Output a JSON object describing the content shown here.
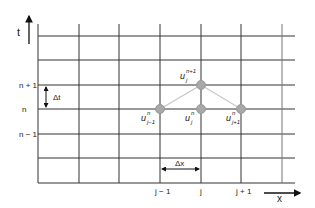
{
  "diagram": {
    "axes": {
      "t_label": "t",
      "x_label": "x"
    },
    "row_labels": [
      {
        "text": "n + 1",
        "y": 85
      },
      {
        "text": "n",
        "y": 109
      },
      {
        "text": "n − 1",
        "y": 134
      }
    ],
    "col_labels": [
      {
        "text": "j − 1",
        "x": 160
      },
      {
        "text": "j",
        "x": 201
      },
      {
        "text": "j + 1",
        "x": 241
      }
    ],
    "step_labels": {
      "dt": "Δt",
      "dx": "Δx"
    },
    "nodes": [
      {
        "id": "u_j_n1",
        "base": "u",
        "sub": "j",
        "sup": "n+1",
        "x": 201,
        "y": 85
      },
      {
        "id": "u_jm1_n",
        "base": "u",
        "sub": "j−1",
        "sup": "n",
        "x": 160,
        "y": 109
      },
      {
        "id": "u_j_n",
        "base": "u",
        "sub": "j",
        "sup": "n",
        "x": 201,
        "y": 109
      },
      {
        "id": "u_jp1_n",
        "base": "u",
        "sub": "j+1",
        "sup": "n",
        "x": 241,
        "y": 109
      }
    ],
    "grid": {
      "vertical_x": [
        38,
        79,
        119,
        160,
        201,
        241,
        282
      ],
      "horizontal_y": [
        36,
        60,
        85,
        109,
        134,
        158,
        183
      ],
      "line_color": "#333333",
      "node_color": "#a8a8a8",
      "stencil_color": "#c8c8c8"
    }
  }
}
